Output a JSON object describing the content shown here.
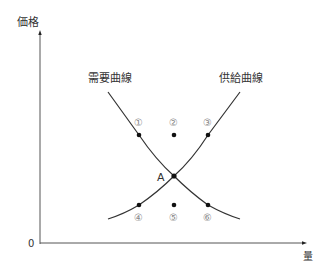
{
  "diagram": {
    "type": "supply-demand",
    "axes": {
      "y_label": "価格",
      "x_label": "量",
      "origin_label": "0"
    },
    "curves": {
      "demand_label": "需要曲線",
      "supply_label": "供給曲線"
    },
    "equilibrium_label": "A",
    "points": [
      {
        "label": "①",
        "position": "on demand curve, above A (left)"
      },
      {
        "label": "②",
        "position": "above A"
      },
      {
        "label": "③",
        "position": "on supply curve, above A (right)"
      },
      {
        "label": "④",
        "position": "on supply curve, below A (left)"
      },
      {
        "label": "⑤",
        "position": "below A"
      },
      {
        "label": "⑥",
        "position": "on demand curve, below A (right)"
      }
    ],
    "colors": {
      "line": "#333333",
      "point": "#111111",
      "number_label": "#888888"
    }
  }
}
